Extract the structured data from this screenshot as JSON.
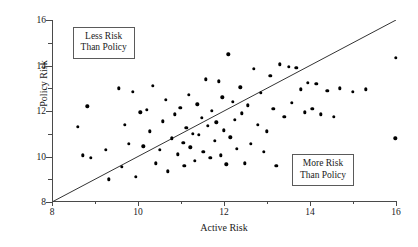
{
  "chart_data": {
    "type": "scatter",
    "title": "",
    "xlabel": "Active Risk",
    "ylabel": "Policy Risk",
    "xlim": [
      8,
      16
    ],
    "ylim": [
      8,
      16
    ],
    "grid": false,
    "legend": null,
    "x_ticks": [
      8,
      10,
      12,
      14,
      16
    ],
    "y_ticks": [
      8,
      10,
      12,
      14,
      16
    ],
    "x_tick_labels": [
      "8",
      "10",
      "12",
      "14",
      "16"
    ],
    "y_tick_labels": [
      "8",
      "10",
      "12",
      "14",
      "16"
    ],
    "x_minor_ticks": [
      9,
      11,
      13,
      15
    ],
    "y_minor_ticks": [
      9,
      11,
      13,
      15
    ],
    "reference_line": {
      "name": "identity-line",
      "type": "line",
      "x": [
        8,
        16
      ],
      "y": [
        8,
        16
      ],
      "color": "#333333"
    },
    "annotations": [
      {
        "name": "less-risk-than-policy",
        "line1": "Less Risk",
        "line2": "Than Policy",
        "x": 9.2,
        "y": 15.0
      },
      {
        "name": "more-risk-than-policy",
        "line1": "More Risk",
        "line2": "Than Policy",
        "x": 14.3,
        "y": 9.4
      }
    ],
    "series": [
      {
        "name": "funds",
        "marker": "circle",
        "color": "#000000",
        "points": [
          [
            8.6,
            11.3
          ],
          [
            8.72,
            10.05
          ],
          [
            8.82,
            12.2
          ],
          [
            8.9,
            9.95
          ],
          [
            9.25,
            10.3
          ],
          [
            9.32,
            9.0
          ],
          [
            9.55,
            13.0
          ],
          [
            9.62,
            9.55
          ],
          [
            9.7,
            11.4
          ],
          [
            9.78,
            10.55
          ],
          [
            9.88,
            12.85
          ],
          [
            9.95,
            9.1
          ],
          [
            10.05,
            11.95
          ],
          [
            10.12,
            10.45
          ],
          [
            10.2,
            12.05
          ],
          [
            10.28,
            11.1
          ],
          [
            10.35,
            13.1
          ],
          [
            10.42,
            9.7
          ],
          [
            10.5,
            10.3
          ],
          [
            10.58,
            11.55
          ],
          [
            10.65,
            12.5
          ],
          [
            10.7,
            9.35
          ],
          [
            10.78,
            10.8
          ],
          [
            10.85,
            11.85
          ],
          [
            10.92,
            10.1
          ],
          [
            10.98,
            12.15
          ],
          [
            11.05,
            10.6
          ],
          [
            11.08,
            9.6
          ],
          [
            11.12,
            11.25
          ],
          [
            11.18,
            12.7
          ],
          [
            11.22,
            10.4
          ],
          [
            11.28,
            11.0
          ],
          [
            11.32,
            9.8
          ],
          [
            11.38,
            12.3
          ],
          [
            11.42,
            10.95
          ],
          [
            11.48,
            11.7
          ],
          [
            11.52,
            10.2
          ],
          [
            11.58,
            13.4
          ],
          [
            11.62,
            11.35
          ],
          [
            11.68,
            9.95
          ],
          [
            11.72,
            12.0
          ],
          [
            11.78,
            10.7
          ],
          [
            11.82,
            11.5
          ],
          [
            11.88,
            13.3
          ],
          [
            11.92,
            10.05
          ],
          [
            11.96,
            12.6
          ],
          [
            12.0,
            11.15
          ],
          [
            12.05,
            9.65
          ],
          [
            12.1,
            14.5
          ],
          [
            12.15,
            10.85
          ],
          [
            12.2,
            12.4
          ],
          [
            12.25,
            11.6
          ],
          [
            12.3,
            10.35
          ],
          [
            12.38,
            13.05
          ],
          [
            12.42,
            11.9
          ],
          [
            12.48,
            9.7
          ],
          [
            12.55,
            12.25
          ],
          [
            12.62,
            10.55
          ],
          [
            12.7,
            13.85
          ],
          [
            12.78,
            11.4
          ],
          [
            12.85,
            12.8
          ],
          [
            12.92,
            10.2
          ],
          [
            13.0,
            11.1
          ],
          [
            13.08,
            13.55
          ],
          [
            13.15,
            12.1
          ],
          [
            13.22,
            9.6
          ],
          [
            13.3,
            14.05
          ],
          [
            13.4,
            11.75
          ],
          [
            13.5,
            13.95
          ],
          [
            13.58,
            12.35
          ],
          [
            13.68,
            13.9
          ],
          [
            13.78,
            12.95
          ],
          [
            13.88,
            11.95
          ],
          [
            13.95,
            13.25
          ],
          [
            14.05,
            12.1
          ],
          [
            14.15,
            13.2
          ],
          [
            14.25,
            11.85
          ],
          [
            14.4,
            12.9
          ],
          [
            14.55,
            11.75
          ],
          [
            14.7,
            13.0
          ],
          [
            15.0,
            12.85
          ],
          [
            15.3,
            12.95
          ],
          [
            16.0,
            14.35
          ],
          [
            15.98,
            10.8
          ]
        ]
      }
    ]
  }
}
